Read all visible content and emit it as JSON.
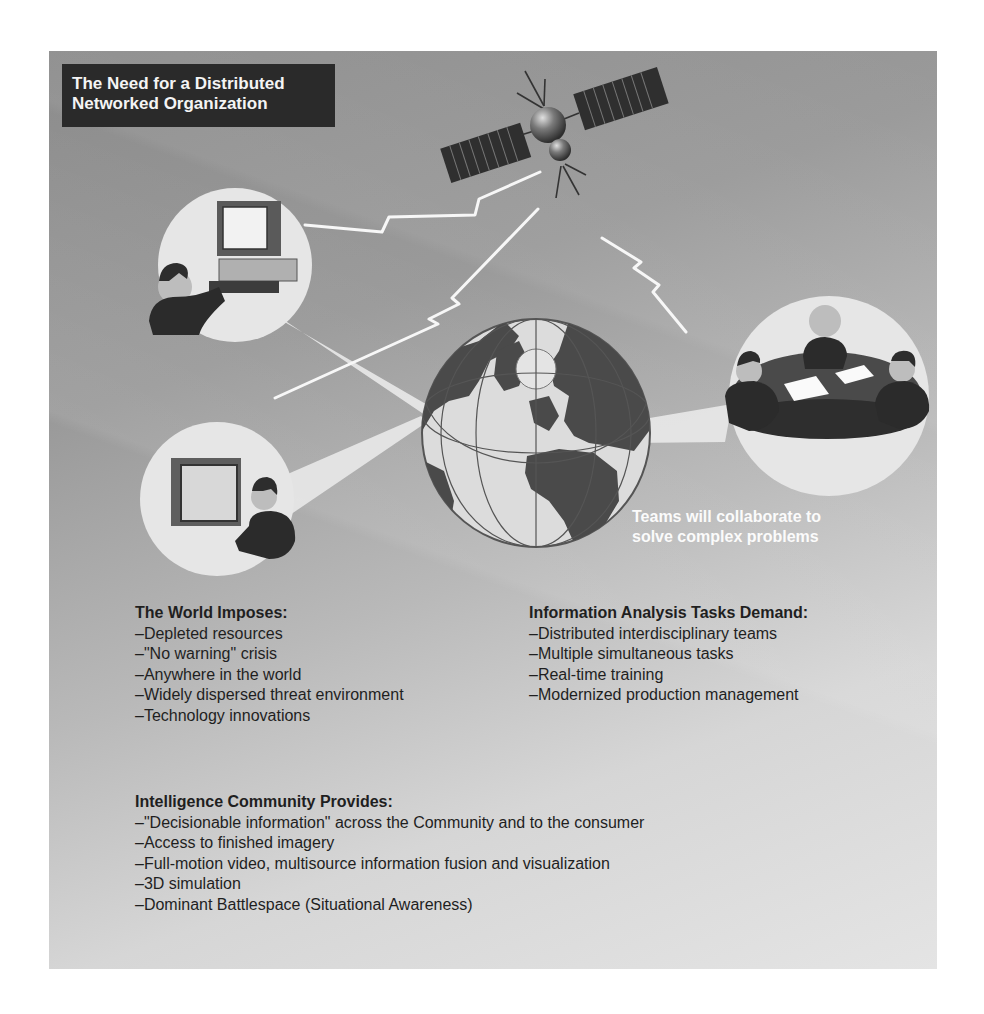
{
  "title": {
    "line1": "The Need for a Distributed",
    "line2": "Networked Organization"
  },
  "illustration": {
    "satellite": "satellite-icon",
    "globe": "globe-icon",
    "bubbles": [
      "analyst-at-workstation",
      "analyst-at-display-screen",
      "team-at-round-table"
    ],
    "links": "lightning-bolt-communication-links"
  },
  "caption": {
    "line1": "Teams will collaborate to",
    "line2": "solve complex problems"
  },
  "sections": {
    "world": {
      "heading": "The World Imposes:",
      "items": [
        "–Depleted resources",
        "–\"No warning\" crisis",
        "–Anywhere in the world",
        "–Widely dispersed threat environment",
        "–Technology innovations"
      ]
    },
    "info": {
      "heading": "Information Analysis Tasks Demand:",
      "items": [
        "–Distributed interdisciplinary teams",
        "–Multiple simultaneous tasks",
        "–Real-time training",
        "–Modernized production management"
      ]
    },
    "ic": {
      "heading": "Intelligence Community Provides:",
      "items": [
        "–\"Decisionable information\" across the Community and to the consumer",
        "–Access to finished imagery",
        "–Full-motion video, multisource information fusion and visualization",
        "–3D simulation",
        "–Dominant Battlespace (Situational Awareness)"
      ]
    }
  },
  "colors": {
    "title_bg": "#2a2a2a",
    "title_text": "#f4f4f4",
    "bubble": "#e6e6e6",
    "land": "#4a4a4a",
    "ocean": "#dcdcdc",
    "text": "#1f1f1f"
  }
}
